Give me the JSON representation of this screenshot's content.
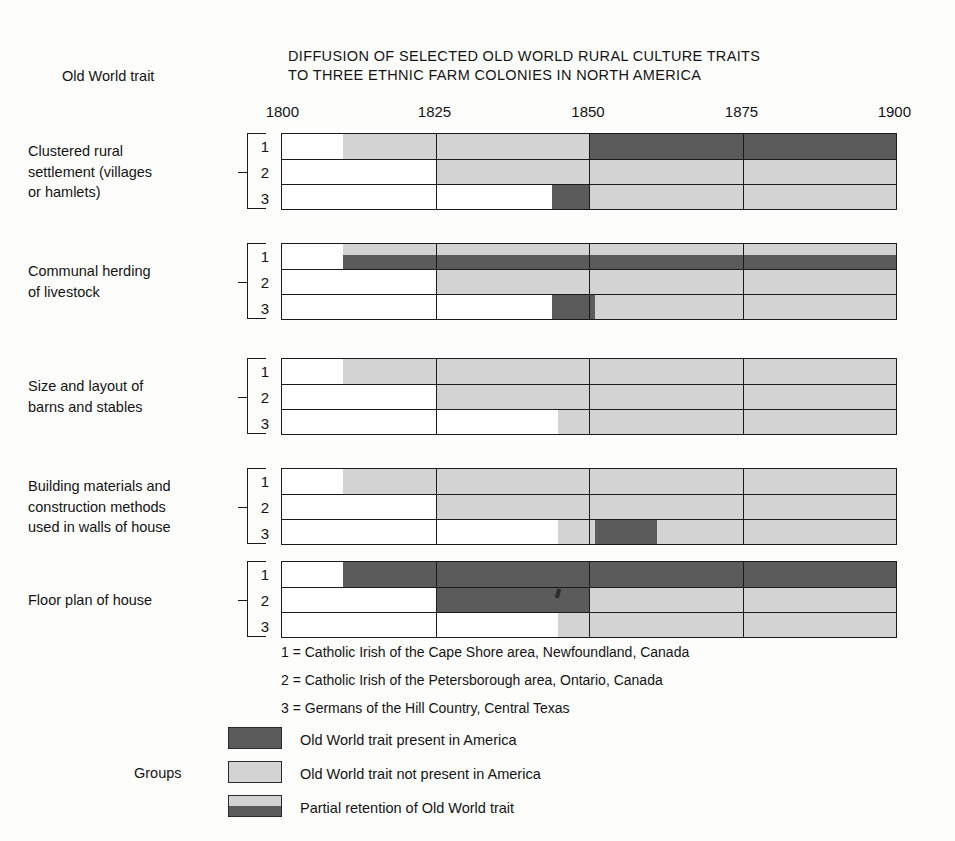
{
  "header": {
    "title_line1": "DIFFUSION OF SELECTED OLD WORLD RURAL CULTURE TRAITS",
    "title_line2": "TO THREE ETHNIC FARM COLONIES IN NORTH AMERICA",
    "row_header": "Old World trait"
  },
  "legend": {
    "groups_caption": "Groups",
    "group_definitions": [
      "1 = Catholic Irish of the Cape Shore area, Newfoundland, Canada",
      "2 = Catholic Irish of the Petersborough area, Ontario, Canada",
      "3 = Germans of the Hill Country, Central Texas"
    ],
    "swatches": [
      {
        "key": "present",
        "label": "Old World trait present in America",
        "color": "#5b5b5b"
      },
      {
        "key": "absent",
        "label": "Old World trait not present in America",
        "color": "#d3d3d3"
      },
      {
        "key": "partial",
        "label": "Partial retention of Old World trait",
        "color": "#d3d3d3/#5b5b5b"
      }
    ]
  },
  "group_numbers": [
    "1",
    "2",
    "3"
  ],
  "chart_data": {
    "type": "bar",
    "title": "DIFFUSION OF SELECTED OLD WORLD RURAL CULTURE TRAITS TO THREE ETHNIC FARM COLONIES IN NORTH AMERICA",
    "subtitle": "",
    "xlabel": "",
    "ylabel": "Old World trait",
    "xlim": [
      1800,
      1900
    ],
    "xticks": [
      1800,
      1825,
      1850,
      1875,
      1900
    ],
    "xtick_labels": [
      "1800",
      "1825",
      "1850",
      "1875",
      "1900"
    ],
    "grid": true,
    "gridlines_x": [
      1825,
      1850,
      1875
    ],
    "legend_position": "bottom-left",
    "state_colors": {
      "none": "#ffffff",
      "present": "#5b5b5b",
      "absent": "#d3d3d3",
      "partial": "#d3d3d3 over #5b5b5b"
    },
    "groups": [
      {
        "id": "1",
        "label": "Catholic Irish of the Cape Shore area, Newfoundland, Canada"
      },
      {
        "id": "2",
        "label": "Catholic Irish of the Petersborough area, Ontario, Canada"
      },
      {
        "id": "3",
        "label": "Germans of the Hill Country, Central Texas"
      }
    ],
    "traits": [
      {
        "name": "Clustered rural settlement (villages or hamlets)",
        "label_lines": [
          "Clustered rural",
          "settlement (villages",
          "or hamlets)"
        ],
        "rows": [
          {
            "group": "1",
            "segments": [
              {
                "state": "absent",
                "start": 1810,
                "end": 1850
              },
              {
                "state": "present",
                "start": 1850,
                "end": 1900
              }
            ]
          },
          {
            "group": "2",
            "segments": [
              {
                "state": "absent",
                "start": 1825,
                "end": 1900
              }
            ]
          },
          {
            "group": "3",
            "segments": [
              {
                "state": "present",
                "start": 1844,
                "end": 1850
              },
              {
                "state": "absent",
                "start": 1850,
                "end": 1900
              }
            ]
          }
        ]
      },
      {
        "name": "Communal herding of livestock",
        "label_lines": [
          "Communal herding",
          "of livestock"
        ],
        "rows": [
          {
            "group": "1",
            "segments": [
              {
                "state": "partial",
                "start": 1810,
                "end": 1900
              }
            ]
          },
          {
            "group": "2",
            "segments": [
              {
                "state": "absent",
                "start": 1825,
                "end": 1900
              }
            ]
          },
          {
            "group": "3",
            "segments": [
              {
                "state": "present",
                "start": 1844,
                "end": 1851
              },
              {
                "state": "absent",
                "start": 1851,
                "end": 1900
              }
            ]
          }
        ]
      },
      {
        "name": "Size and layout of barns and stables",
        "label_lines": [
          "Size and layout of",
          "barns and stables"
        ],
        "rows": [
          {
            "group": "1",
            "segments": [
              {
                "state": "absent",
                "start": 1810,
                "end": 1900
              }
            ]
          },
          {
            "group": "2",
            "segments": [
              {
                "state": "absent",
                "start": 1825,
                "end": 1900
              }
            ]
          },
          {
            "group": "3",
            "segments": [
              {
                "state": "absent",
                "start": 1845,
                "end": 1900
              }
            ]
          }
        ]
      },
      {
        "name": "Building materials and construction methods used in walls of house",
        "label_lines": [
          "Building materials and",
          "construction methods",
          "used in walls of house"
        ],
        "rows": [
          {
            "group": "1",
            "segments": [
              {
                "state": "absent",
                "start": 1810,
                "end": 1900
              }
            ]
          },
          {
            "group": "2",
            "segments": [
              {
                "state": "absent",
                "start": 1825,
                "end": 1900
              }
            ]
          },
          {
            "group": "3",
            "segments": [
              {
                "state": "absent",
                "start": 1845,
                "end": 1851
              },
              {
                "state": "present",
                "start": 1851,
                "end": 1861
              },
              {
                "state": "absent",
                "start": 1861,
                "end": 1900
              }
            ]
          }
        ]
      },
      {
        "name": "Floor plan of house",
        "label_lines": [
          "Floor plan of house"
        ],
        "rows": [
          {
            "group": "1",
            "segments": [
              {
                "state": "present",
                "start": 1810,
                "end": 1900
              }
            ]
          },
          {
            "group": "2",
            "segments": [
              {
                "state": "present",
                "start": 1825,
                "end": 1850
              },
              {
                "state": "absent",
                "start": 1850,
                "end": 1900
              }
            ]
          },
          {
            "group": "3",
            "segments": [
              {
                "state": "absent",
                "start": 1845,
                "end": 1900
              }
            ]
          }
        ]
      }
    ]
  }
}
